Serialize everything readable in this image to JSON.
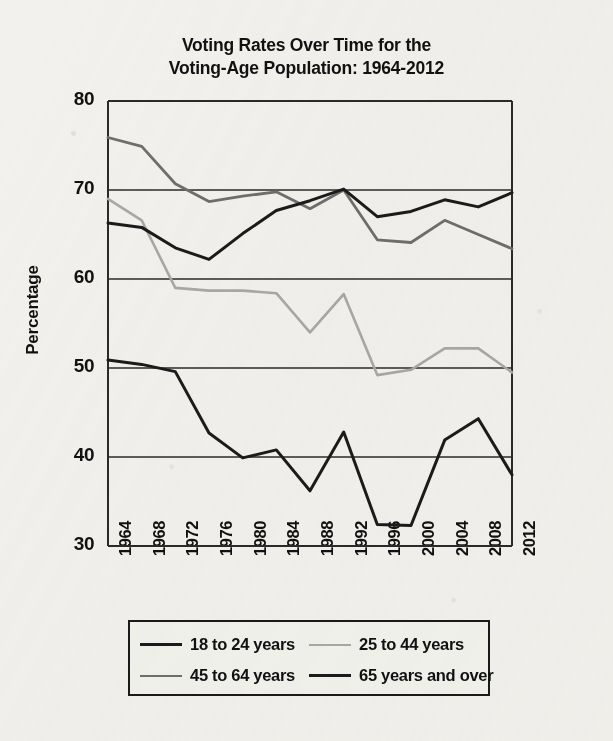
{
  "chart_data": {
    "type": "line",
    "title": "Voting Rates Over Time for the Voting-Age Population: 1964-2012",
    "title_line1": "Voting Rates Over Time for the",
    "title_line2": "Voting-Age Population: 1964-2012",
    "xlabel": "",
    "ylabel": "Percentage",
    "x": [
      1964,
      1968,
      1972,
      1976,
      1980,
      1984,
      1988,
      1992,
      1996,
      2000,
      2004,
      2008,
      2012
    ],
    "categories": [
      "1964",
      "1968",
      "1972",
      "1976",
      "1980",
      "1984",
      "1988",
      "1992",
      "1996",
      "2000",
      "2004",
      "2008",
      "2012"
    ],
    "ylim": [
      30,
      80
    ],
    "yticks": [
      30,
      40,
      50,
      60,
      70,
      80
    ],
    "ytick_labels": [
      "30",
      "40",
      "50",
      "60",
      "70",
      "80"
    ],
    "grid": true,
    "grid_axis": "y",
    "legend_position": "bottom",
    "series": [
      {
        "name": "18 to 24 years",
        "color": "#1b1b1b",
        "width": 3.0,
        "values": [
          50.9,
          50.4,
          49.6,
          42.7,
          39.9,
          40.8,
          36.2,
          42.8,
          32.4,
          32.3,
          41.9,
          44.3,
          38.0
        ]
      },
      {
        "name": "25 to 44 years",
        "color": "#a8a8a8",
        "width": 2.6,
        "values": [
          69.0,
          66.6,
          59.0,
          58.7,
          58.7,
          58.4,
          54.0,
          58.3,
          49.2,
          49.8,
          52.2,
          52.2,
          49.5
        ]
      },
      {
        "name": "45 to 64 years",
        "color": "#6e6e6e",
        "width": 2.8,
        "values": [
          75.9,
          74.9,
          70.7,
          68.7,
          69.3,
          69.8,
          67.9,
          70.0,
          64.4,
          64.1,
          66.6,
          65.0,
          63.4
        ]
      },
      {
        "name": "65 years and over",
        "color": "#1b1b1b",
        "width": 3.0,
        "values": [
          66.3,
          65.8,
          63.5,
          62.2,
          65.1,
          67.7,
          68.8,
          70.1,
          67.0,
          67.6,
          68.9,
          68.1,
          69.7
        ]
      }
    ]
  },
  "legend": {
    "items": [
      {
        "label": "18 to 24 years",
        "color": "#1b1b1b",
        "width": "3px"
      },
      {
        "label": "25 to 44 years",
        "color": "#a8a8a8",
        "width": "2.6px"
      },
      {
        "label": "45 to 64 years",
        "color": "#6e6e6e",
        "width": "2.8px"
      },
      {
        "label": "65 years and over",
        "color": "#1b1b1b",
        "width": "3px"
      }
    ]
  }
}
